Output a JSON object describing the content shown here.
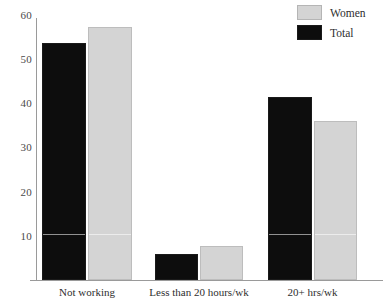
{
  "chart_data": {
    "type": "bar",
    "title": "",
    "subtitle": "",
    "xlabel": "",
    "ylabel": "",
    "categories": [
      "Not working",
      "Less than 20 hours/wk",
      "20+ hrs/wk"
    ],
    "series": [
      {
        "name": "Total",
        "color": "#0d0d0d",
        "values": [
          53.6,
          5.9,
          41.4
        ]
      },
      {
        "name": "Women",
        "color": "#d4d4d4",
        "values": [
          57.2,
          7.7,
          35.9
        ]
      }
    ],
    "series_order_in_plot": [
      "Total",
      "Women"
    ],
    "yticks": [
      10,
      20,
      30,
      40,
      50,
      60
    ],
    "ytick_labels": [
      "10",
      "20",
      "30",
      "40",
      "50",
      "60"
    ],
    "ylim": [
      0,
      61
    ],
    "xlim_categories": 3,
    "grid": false,
    "legend": {
      "position": "top-right",
      "entries": [
        {
          "label": "Women",
          "color": "#d4d4d4"
        },
        {
          "label": "Total",
          "color": "#0d0d0d"
        }
      ]
    },
    "axis_color": "#9a9a9a",
    "background": "#ffffff"
  }
}
